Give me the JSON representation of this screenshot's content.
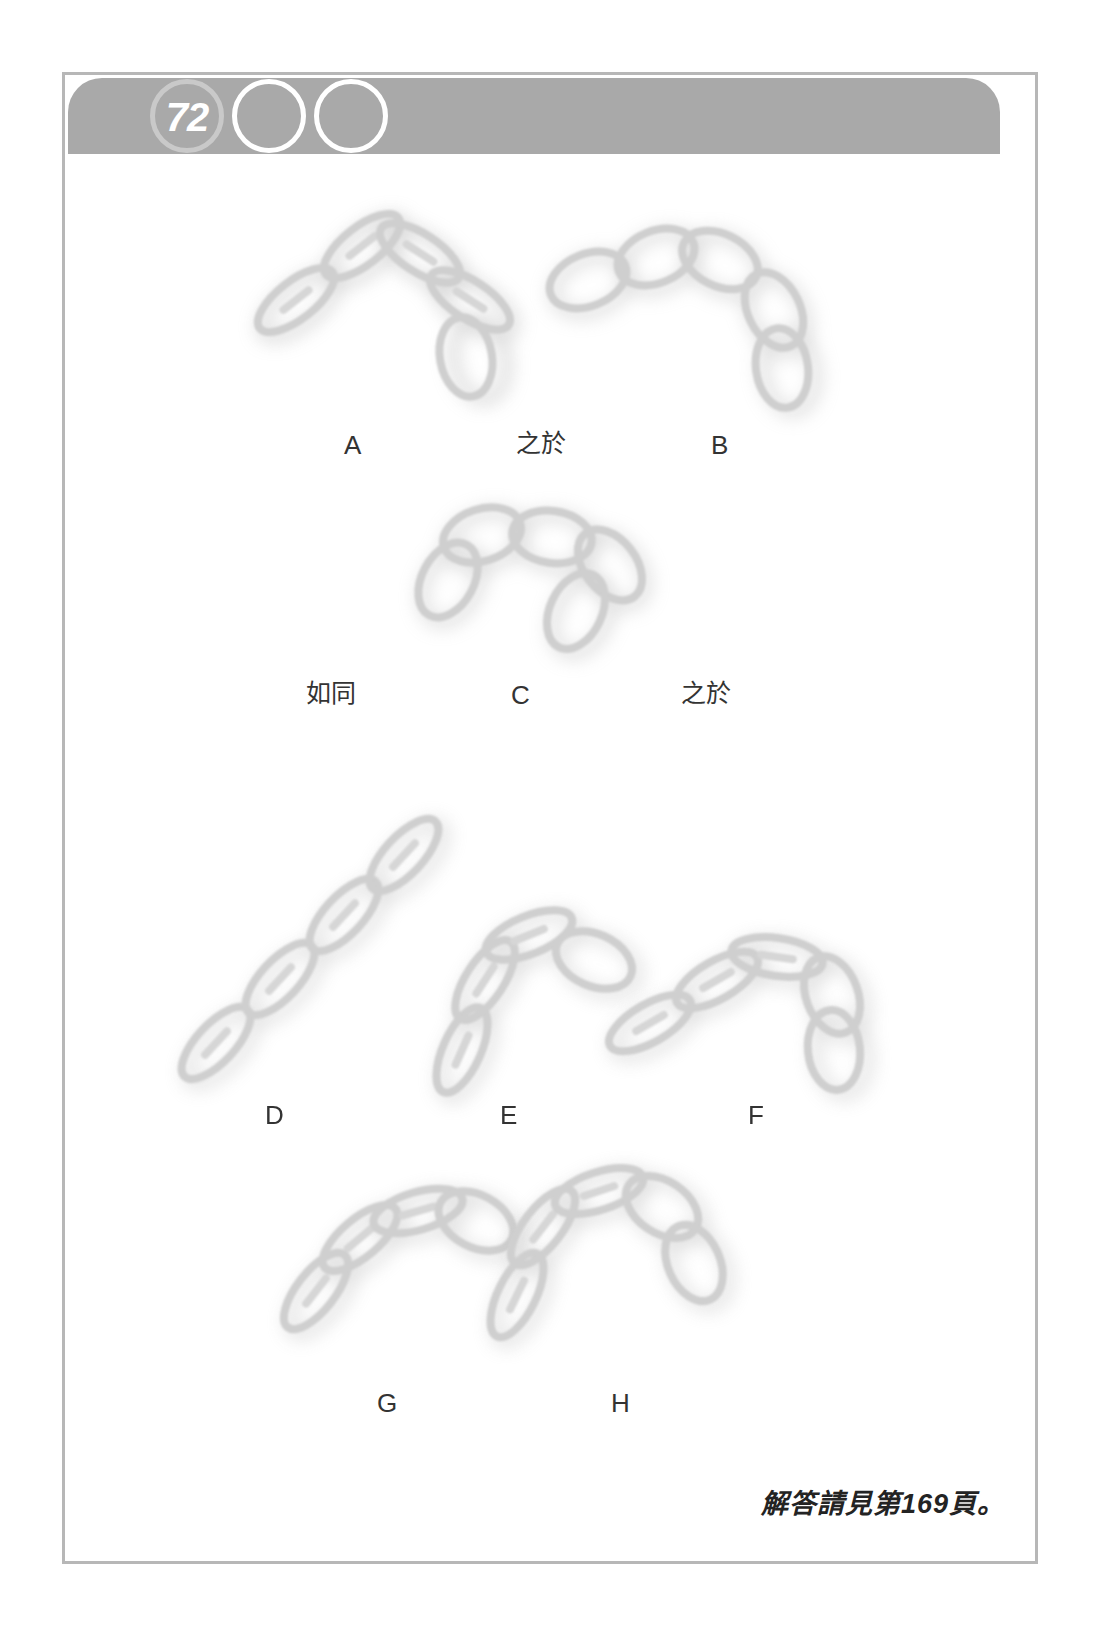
{
  "page": {
    "number": "72",
    "header_circle_count": 3
  },
  "puzzle": {
    "type": "visual-analogy",
    "relations": {
      "is_to": "之於",
      "as": "如同"
    },
    "prompt_row_1": [
      "A",
      "之於",
      "B"
    ],
    "prompt_row_2": [
      "如同",
      "C",
      "之於"
    ],
    "figure_labels": {
      "a": "A",
      "b": "B",
      "c": "C",
      "d": "D",
      "e": "E",
      "f": "F",
      "g": "G",
      "h": "H"
    },
    "option_labels": [
      "D",
      "E",
      "F",
      "G",
      "H"
    ]
  },
  "footer": {
    "answer_note": "解答請見第169頁。"
  },
  "colors": {
    "header_bar": "#a9a9a9",
    "page_number_text": "#ffffff",
    "first_circle_ring": "#c9c9c9",
    "blank_circle_ring": "#ffffff",
    "frame_border": "#b7b7b7",
    "label_text": "#333333",
    "answer_note_text": "#232323",
    "figure_stroke": "#cfcfcf",
    "figure_shadow": "#b0b0b0",
    "page_background": "#ffffff"
  }
}
